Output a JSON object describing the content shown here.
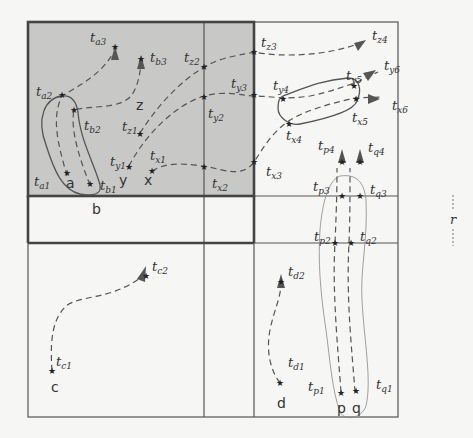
{
  "colors": {
    "background": "#f6f6f4",
    "shaded_cell": "#c8c8c6",
    "grid_line": "#555555",
    "trajectory": "#555555"
  },
  "grid": {
    "outer": {
      "x": 28,
      "y": 22,
      "w": 370,
      "h": 395
    },
    "columns_x": [
      28,
      204,
      254,
      398
    ],
    "rows_y": [
      22,
      196,
      417
    ],
    "shaded_region": {
      "x": 28,
      "y": 22,
      "w": 226,
      "h": 174
    },
    "range_label": "r"
  },
  "objects": [
    {
      "id": "a",
      "label": "a",
      "x": 68,
      "y": 184
    },
    {
      "id": "b",
      "label": "b",
      "x": 92,
      "y": 212
    },
    {
      "id": "c",
      "label": "c",
      "x": 54,
      "y": 389
    },
    {
      "id": "d",
      "label": "d",
      "x": 280,
      "y": 405
    },
    {
      "id": "p",
      "label": "p",
      "x": 340,
      "y": 410
    },
    {
      "id": "q",
      "label": "q",
      "x": 356,
      "y": 410
    },
    {
      "id": "x",
      "label": "x",
      "x": 147,
      "y": 182
    },
    {
      "id": "y",
      "label": "y",
      "x": 122,
      "y": 182
    },
    {
      "id": "z",
      "label": "z",
      "x": 140,
      "y": 107
    }
  ],
  "timestamps": [
    {
      "base": "t",
      "sub": "a1",
      "x": 34,
      "y": 186
    },
    {
      "base": "t",
      "sub": "a2",
      "x": 36,
      "y": 96
    },
    {
      "base": "t",
      "sub": "a3",
      "x": 90,
      "y": 42
    },
    {
      "base": "t",
      "sub": "b1",
      "x": 100,
      "y": 190
    },
    {
      "base": "t",
      "sub": "b2",
      "x": 84,
      "y": 130
    },
    {
      "base": "t",
      "sub": "b3",
      "x": 150,
      "y": 62
    },
    {
      "base": "t",
      "sub": "c1",
      "x": 56,
      "y": 366
    },
    {
      "base": "t",
      "sub": "c2",
      "x": 152,
      "y": 271
    },
    {
      "base": "t",
      "sub": "d1",
      "x": 288,
      "y": 367
    },
    {
      "base": "t",
      "sub": "d2",
      "x": 288,
      "y": 276
    },
    {
      "base": "t",
      "sub": "p1",
      "x": 308,
      "y": 391
    },
    {
      "base": "t",
      "sub": "p2",
      "x": 314,
      "y": 241
    },
    {
      "base": "t",
      "sub": "p3",
      "x": 313,
      "y": 191
    },
    {
      "base": "t",
      "sub": "p4",
      "x": 318,
      "y": 150
    },
    {
      "base": "t",
      "sub": "q1",
      "x": 376,
      "y": 389
    },
    {
      "base": "t",
      "sub": "q2",
      "x": 360,
      "y": 241
    },
    {
      "base": "t",
      "sub": "q3",
      "x": 370,
      "y": 194
    },
    {
      "base": "t",
      "sub": "q4",
      "x": 368,
      "y": 152
    },
    {
      "base": "t",
      "sub": "x1",
      "x": 150,
      "y": 160
    },
    {
      "base": "t",
      "sub": "x2",
      "x": 212,
      "y": 188
    },
    {
      "base": "t",
      "sub": "x3",
      "x": 266,
      "y": 176
    },
    {
      "base": "t",
      "sub": "x4",
      "x": 286,
      "y": 140
    },
    {
      "base": "t",
      "sub": "x5",
      "x": 352,
      "y": 122
    },
    {
      "base": "t",
      "sub": "x6",
      "x": 392,
      "y": 110
    },
    {
      "base": "t",
      "sub": "y1",
      "x": 110,
      "y": 166
    },
    {
      "base": "t",
      "sub": "y2",
      "x": 208,
      "y": 118
    },
    {
      "base": "t",
      "sub": "y3",
      "x": 231,
      "y": 88
    },
    {
      "base": "t",
      "sub": "y4",
      "x": 273,
      "y": 90
    },
    {
      "base": "t",
      "sub": "y5",
      "x": 346,
      "y": 80
    },
    {
      "base": "t",
      "sub": "y6",
      "x": 384,
      "y": 70
    },
    {
      "base": "t",
      "sub": "z1",
      "x": 122,
      "y": 131
    },
    {
      "base": "t",
      "sub": "z2",
      "x": 184,
      "y": 62
    },
    {
      "base": "t",
      "sub": "z3",
      "x": 261,
      "y": 47
    },
    {
      "base": "t",
      "sub": "z4",
      "x": 372,
      "y": 40
    }
  ]
}
